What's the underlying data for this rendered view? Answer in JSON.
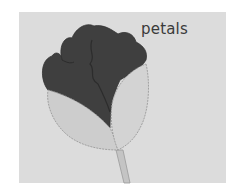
{
  "illustration": {
    "subject": "flower bud",
    "label": "petals",
    "colors": {
      "background": "#ffffff",
      "panel": "#dcdcdc",
      "petals": "#3f3f3f",
      "sepals": "#cdcdcd",
      "outline": "#9a9a9a",
      "stem": "#c4c4c4",
      "label": "#3a3a3a"
    }
  }
}
